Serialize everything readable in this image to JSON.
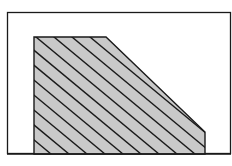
{
  "diagram": {
    "type": "hatched-region",
    "outer_rect": {
      "x": 7,
      "y": 12,
      "width": 224,
      "height": 142,
      "stroke": "#1a1a1a"
    },
    "region": {
      "points": [
        [
          34,
          37
        ],
        [
          106,
          37
        ],
        [
          205,
          132
        ],
        [
          205,
          154
        ],
        [
          34,
          154
        ]
      ],
      "fill": "#c9c9c9",
      "stroke": "#1a1a1a"
    },
    "hatch": {
      "direction": "down-right",
      "slope": 0.83,
      "horizontal_spacing": 18,
      "color": "#1a1a1a"
    }
  },
  "caption": {
    "text": ""
  }
}
